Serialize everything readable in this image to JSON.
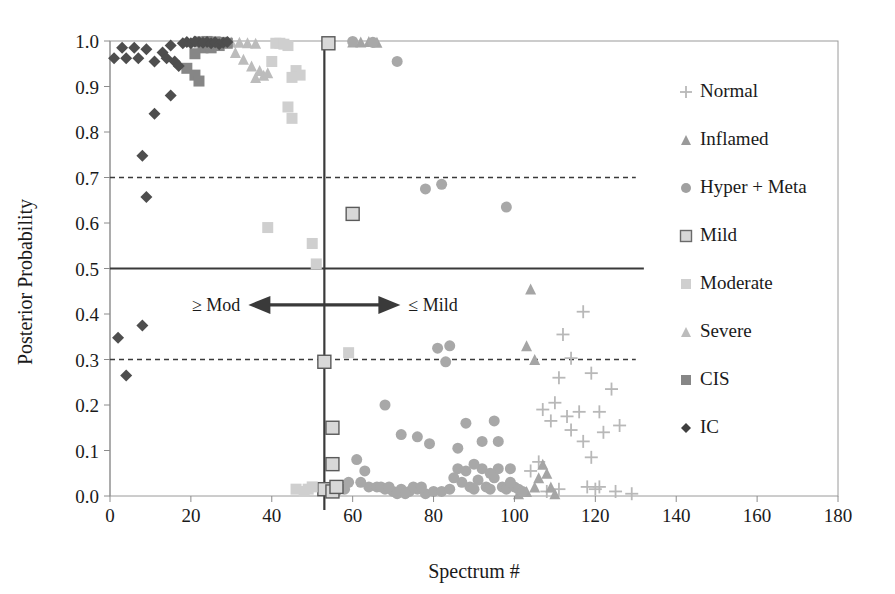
{
  "chart_data": {
    "type": "scatter",
    "title": "",
    "xlabel": "Spectrum #",
    "ylabel": "Posterior Probability",
    "xlim": [
      0,
      180
    ],
    "ylim": [
      0.0,
      1.0
    ],
    "xticks": [
      0,
      20,
      40,
      60,
      80,
      100,
      120,
      140,
      160,
      180
    ],
    "xtick_labels": [
      "0",
      "20",
      "40",
      "60",
      "80",
      "100",
      "120",
      "140",
      "160",
      "180"
    ],
    "yticks": [
      0.0,
      0.1,
      0.2,
      0.3,
      0.4,
      0.5,
      0.6,
      0.7,
      0.8,
      0.9,
      1.0
    ],
    "ytick_labels": [
      "0.0",
      "0.1",
      "0.2",
      "0.3",
      "0.4",
      "0.5",
      "0.6",
      "0.7",
      "0.8",
      "0.9",
      "1.0"
    ],
    "grid": false,
    "legend_position": "right",
    "reference_lines": [
      {
        "name": "threshold-0.7",
        "orientation": "horizontal",
        "value": 0.7,
        "style": "dashed",
        "x_end": 130,
        "color": "#3a3a3a"
      },
      {
        "name": "threshold-0.5",
        "orientation": "horizontal",
        "value": 0.5,
        "style": "solid",
        "x_end": 132,
        "color": "#3a3a3a"
      },
      {
        "name": "threshold-0.3",
        "orientation": "horizontal",
        "value": 0.3,
        "style": "dashed",
        "x_end": 130,
        "color": "#3a3a3a"
      },
      {
        "name": "decision-boundary",
        "orientation": "vertical",
        "value": 53,
        "style": "solid",
        "color": "#3a3a3a"
      }
    ],
    "annotations": [
      {
        "name": "ge-mod-label",
        "text": "≥ Mod",
        "x": 30,
        "y": 0.42
      },
      {
        "name": "le-mild-label",
        "text": "≤ Mild",
        "x": 76,
        "y": 0.42
      },
      {
        "name": "double-arrow",
        "text": "←→",
        "x": 53,
        "y": 0.42
      }
    ],
    "series": [
      {
        "name": "Normal",
        "marker": "plus",
        "color": "#b8b8b8",
        "points": [
          [
            112,
            0.355
          ],
          [
            117,
            0.405
          ],
          [
            114,
            0.303
          ],
          [
            111,
            0.26
          ],
          [
            119,
            0.27
          ],
          [
            107,
            0.19
          ],
          [
            110,
            0.205
          ],
          [
            113,
            0.175
          ],
          [
            109,
            0.165
          ],
          [
            116,
            0.185
          ],
          [
            121,
            0.185
          ],
          [
            114,
            0.145
          ],
          [
            117,
            0.12
          ],
          [
            119,
            0.085
          ],
          [
            124,
            0.235
          ],
          [
            122,
            0.14
          ],
          [
            126,
            0.155
          ],
          [
            108,
            0.01
          ],
          [
            111,
            0.015
          ],
          [
            118,
            0.02
          ],
          [
            120,
            0.015
          ],
          [
            121,
            0.02
          ],
          [
            125,
            0.01
          ],
          [
            129,
            0.005
          ],
          [
            104,
            0.055
          ],
          [
            106,
            0.075
          ]
        ]
      },
      {
        "name": "Inflamed",
        "marker": "triangle",
        "color": "#a5a5a5",
        "points": [
          [
            60,
            0.998
          ],
          [
            62,
            0.998
          ],
          [
            64,
            0.999
          ],
          [
            66,
            0.997
          ],
          [
            104,
            0.455
          ],
          [
            103,
            0.33
          ],
          [
            105,
            0.3
          ],
          [
            101,
            0.005
          ],
          [
            103,
            0.01
          ],
          [
            105,
            0.02
          ],
          [
            106,
            0.04
          ],
          [
            107,
            0.07
          ],
          [
            108,
            0.05
          ],
          [
            109,
            0.02
          ],
          [
            110,
            0.005
          ]
        ]
      },
      {
        "name": "Hyper + Meta",
        "marker": "circle",
        "color": "#a8a8a8",
        "points": [
          [
            60,
            0.999
          ],
          [
            65,
            0.997
          ],
          [
            71,
            0.955
          ],
          [
            78,
            0.675
          ],
          [
            82,
            0.685
          ],
          [
            98,
            0.635
          ],
          [
            68,
            0.2
          ],
          [
            81,
            0.325
          ],
          [
            84,
            0.33
          ],
          [
            83,
            0.295
          ],
          [
            88,
            0.16
          ],
          [
            72,
            0.135
          ],
          [
            76,
            0.13
          ],
          [
            79,
            0.115
          ],
          [
            86,
            0.105
          ],
          [
            92,
            0.12
          ],
          [
            95,
            0.165
          ],
          [
            96,
            0.12
          ],
          [
            61,
            0.08
          ],
          [
            63,
            0.055
          ],
          [
            64,
            0.02
          ],
          [
            66,
            0.02
          ],
          [
            68,
            0.015
          ],
          [
            70,
            0.01
          ],
          [
            72,
            0.015
          ],
          [
            74,
            0.01
          ],
          [
            76,
            0.015
          ],
          [
            78,
            0.005
          ],
          [
            80,
            0.01
          ],
          [
            82,
            0.01
          ],
          [
            84,
            0.015
          ],
          [
            86,
            0.06
          ],
          [
            87,
            0.03
          ],
          [
            88,
            0.055
          ],
          [
            89,
            0.02
          ],
          [
            90,
            0.015
          ],
          [
            91,
            0.035
          ],
          [
            92,
            0.06
          ],
          [
            93,
            0.02
          ],
          [
            94,
            0.015
          ],
          [
            95,
            0.04
          ],
          [
            96,
            0.06
          ],
          [
            97,
            0.02
          ],
          [
            98,
            0.015
          ],
          [
            99,
            0.06
          ],
          [
            100,
            0.02
          ],
          [
            101,
            0.015
          ],
          [
            102,
            0.01
          ],
          [
            56,
            0.01
          ],
          [
            58,
            0.015
          ],
          [
            59,
            0.03
          ],
          [
            62,
            0.03
          ],
          [
            67,
            0.02
          ],
          [
            69,
            0.02
          ],
          [
            71,
            0.005
          ],
          [
            73,
            0.005
          ],
          [
            75,
            0.02
          ],
          [
            77,
            0.02
          ],
          [
            85,
            0.04
          ],
          [
            90,
            0.07
          ],
          [
            94,
            0.05
          ],
          [
            99,
            0.03
          ]
        ]
      },
      {
        "name": "Mild",
        "marker": "square-open",
        "color": "#d8d8d8",
        "edge": "#5a5a5a",
        "points": [
          [
            54,
            0.995
          ],
          [
            60,
            0.62
          ],
          [
            53,
            0.295
          ],
          [
            55,
            0.15
          ],
          [
            55,
            0.07
          ],
          [
            53,
            0.015
          ],
          [
            55,
            0.01
          ],
          [
            56,
            0.02
          ]
        ]
      },
      {
        "name": "Moderate",
        "marker": "square",
        "color": "#cfcfcf",
        "points": [
          [
            41,
            0.995
          ],
          [
            42,
            0.995
          ],
          [
            43,
            0.993
          ],
          [
            44,
            0.99
          ],
          [
            40,
            0.955
          ],
          [
            46,
            0.935
          ],
          [
            47,
            0.925
          ],
          [
            45,
            0.92
          ],
          [
            44,
            0.855
          ],
          [
            45,
            0.83
          ],
          [
            39,
            0.59
          ],
          [
            50,
            0.555
          ],
          [
            51,
            0.51
          ],
          [
            59,
            0.315
          ],
          [
            48,
            0.01
          ],
          [
            49,
            0.015
          ],
          [
            50,
            0.02
          ],
          [
            46,
            0.015
          ]
        ]
      },
      {
        "name": "Severe",
        "marker": "triangle",
        "color": "#bcbcbc",
        "points": [
          [
            30,
            0.998
          ],
          [
            32,
            0.997
          ],
          [
            34,
            0.996
          ],
          [
            36,
            0.995
          ],
          [
            31,
            0.975
          ],
          [
            33,
            0.96
          ],
          [
            35,
            0.945
          ],
          [
            37,
            0.935
          ],
          [
            36,
            0.92
          ],
          [
            38,
            0.925
          ],
          [
            39,
            0.93
          ]
        ]
      },
      {
        "name": "CIS",
        "marker": "square",
        "color": "#868686",
        "points": [
          [
            22,
            0.998
          ],
          [
            24,
            0.999
          ],
          [
            26,
            0.998
          ],
          [
            28,
            0.997
          ],
          [
            23,
            0.985
          ],
          [
            25,
            0.985
          ],
          [
            27,
            0.99
          ],
          [
            29,
            0.995
          ],
          [
            21,
            0.972
          ],
          [
            19,
            0.94
          ],
          [
            21,
            0.925
          ],
          [
            22,
            0.912
          ]
        ]
      },
      {
        "name": "IC",
        "marker": "diamond",
        "color": "#4e4e4e",
        "points": [
          [
            1,
            0.962
          ],
          [
            3,
            0.985
          ],
          [
            4,
            0.962
          ],
          [
            6,
            0.985
          ],
          [
            7,
            0.962
          ],
          [
            9,
            0.982
          ],
          [
            11,
            0.955
          ],
          [
            13,
            0.975
          ],
          [
            14,
            0.962
          ],
          [
            15,
            0.99
          ],
          [
            16,
            0.955
          ],
          [
            17,
            0.945
          ],
          [
            19,
            0.998
          ],
          [
            20,
            0.995
          ],
          [
            21,
            0.999
          ],
          [
            22,
            0.998
          ],
          [
            23,
            0.996
          ],
          [
            24,
            0.998
          ],
          [
            25,
            0.995
          ],
          [
            26,
            0.997
          ],
          [
            27,
            0.993
          ],
          [
            28,
            0.996
          ],
          [
            18,
            0.995
          ],
          [
            29,
            0.998
          ],
          [
            15,
            0.88
          ],
          [
            11,
            0.84
          ],
          [
            8,
            0.748
          ],
          [
            9,
            0.657
          ],
          [
            2,
            0.348
          ],
          [
            8,
            0.375
          ],
          [
            4,
            0.265
          ]
        ]
      }
    ]
  },
  "legend": {
    "items": [
      {
        "label": "Normal",
        "marker": "plus",
        "color": "#b8b8b8"
      },
      {
        "label": "Inflamed",
        "marker": "triangle",
        "color": "#9a9a9a"
      },
      {
        "label": "Hyper + Meta",
        "marker": "circle",
        "color": "#a0a0a0"
      },
      {
        "label": "Mild",
        "marker": "square-open",
        "color": "#d8d8d8"
      },
      {
        "label": "Moderate",
        "marker": "square",
        "color": "#cfcfcf"
      },
      {
        "label": "Severe",
        "marker": "triangle",
        "color": "#bcbcbc"
      },
      {
        "label": "CIS",
        "marker": "square",
        "color": "#868686"
      },
      {
        "label": "IC",
        "marker": "diamond",
        "color": "#3f3f3f"
      }
    ]
  },
  "axes": {
    "x_title": "Spectrum #",
    "y_title": "Posterior Probability"
  },
  "colors": {
    "axis": "#8c8c8c",
    "text": "#1a1a1a",
    "reference_line": "#3a3a3a",
    "plot_border": "#9a9a9a"
  }
}
